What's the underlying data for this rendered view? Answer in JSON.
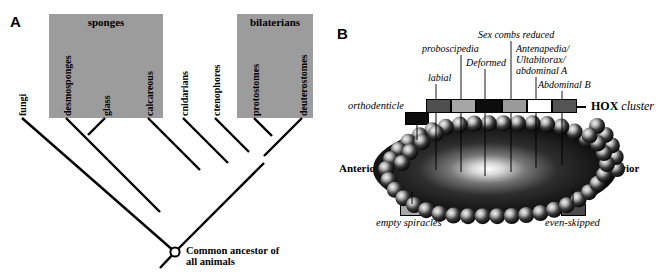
{
  "figure": {
    "panels": [
      {
        "letter": "A"
      },
      {
        "letter": "B"
      }
    ]
  },
  "panel_a": {
    "letter": "A",
    "groups": [
      {
        "name": "sponges",
        "label": "sponges"
      },
      {
        "name": "bilaterians",
        "label": "bilaterians"
      }
    ],
    "tips": [
      {
        "label": "fungi"
      },
      {
        "label": "desmosponges"
      },
      {
        "label": "glass"
      },
      {
        "label": "calcareous"
      },
      {
        "label": "cnidarians"
      },
      {
        "label": "ctenophores"
      },
      {
        "label": "protostomes"
      },
      {
        "label": "deuterostomes"
      }
    ],
    "ancestor": {
      "line1": "Common ancestor of",
      "line2": "all animals"
    }
  },
  "panel_b": {
    "letter": "B",
    "cluster_label_bold": "HOX",
    "cluster_label_italic": "cluster",
    "hox_genes": [
      {
        "label": "labial",
        "color": "#4f4f4f"
      },
      {
        "label": "proboscipedia",
        "color": "#a6a6a6"
      },
      {
        "label": "Deformed",
        "color": "#0d0d0d"
      },
      {
        "label": "Sex combs reduced",
        "color": "#9a9a9a"
      },
      {
        "label": "Antenapedia/\nUltabitorax/\nabdominal A",
        "color": "#ffffff"
      },
      {
        "label": "Abdominal B",
        "color": "#545454"
      }
    ],
    "gene_labels": [
      {
        "text": "labial"
      },
      {
        "text": "proboscipedia"
      },
      {
        "text": "Deformed"
      },
      {
        "text": "Sex combs reduced"
      },
      {
        "text": "Antenapedia/"
      },
      {
        "text": "Ultabitorax/"
      },
      {
        "text": "abdominal A"
      },
      {
        "text": "Abdominal B"
      }
    ],
    "outside_genes": [
      {
        "label": "orthodenticle",
        "color": "#0d0d0d"
      },
      {
        "label": "empty spiracles",
        "color": "#a8a8a8"
      },
      {
        "label": "even-skipped",
        "color": "#4a4a4a"
      }
    ],
    "axis": {
      "anterior": "Anterior",
      "posterior": "Posterior"
    }
  },
  "colors": {
    "group_box": "#9c9c9c",
    "stroke": "#000000",
    "embryo_dark": "#111111",
    "embryo_glow": "#ffffff"
  }
}
